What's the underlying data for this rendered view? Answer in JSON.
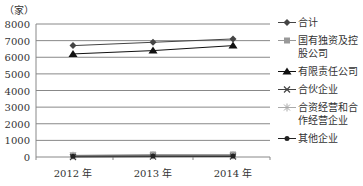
{
  "chart_data": {
    "type": "line",
    "title": "",
    "ylabel": "（家）",
    "xlabel": "",
    "categories": [
      "2012 年",
      "2013 年",
      "2014 年"
    ],
    "ylim": [
      0,
      8000
    ],
    "yticks": [
      0,
      1000,
      2000,
      3000,
      4000,
      5000,
      6000,
      7000,
      8000
    ],
    "grid": true,
    "legend_position": "right",
    "series": [
      {
        "name": "合计",
        "marker": "diamond",
        "color": "#444444",
        "values": [
          6700,
          6900,
          7100
        ]
      },
      {
        "name": "国有独资及控股公司",
        "marker": "square",
        "color": "#999999",
        "values": [
          100,
          150,
          150
        ]
      },
      {
        "name": "有限责任公司",
        "marker": "triangle",
        "color": "#111111",
        "values": [
          6200,
          6400,
          6700
        ]
      },
      {
        "name": "合伙企业",
        "marker": "x",
        "color": "#444444",
        "values": [
          0,
          20,
          30
        ]
      },
      {
        "name": "合资经营和合作经营企业",
        "marker": "star",
        "color": "#aaaaaa",
        "values": [
          80,
          100,
          100
        ]
      },
      {
        "name": "其他企业",
        "marker": "circle",
        "color": "#222222",
        "values": [
          50,
          60,
          60
        ]
      }
    ]
  },
  "legend": {
    "items": [
      {
        "label": "合计"
      },
      {
        "label": "国有独资及控股公司"
      },
      {
        "label": "有限责任公司"
      },
      {
        "label": "合伙企业"
      },
      {
        "label": "合资经营和合作经营企业"
      },
      {
        "label": "其他企业"
      }
    ]
  }
}
